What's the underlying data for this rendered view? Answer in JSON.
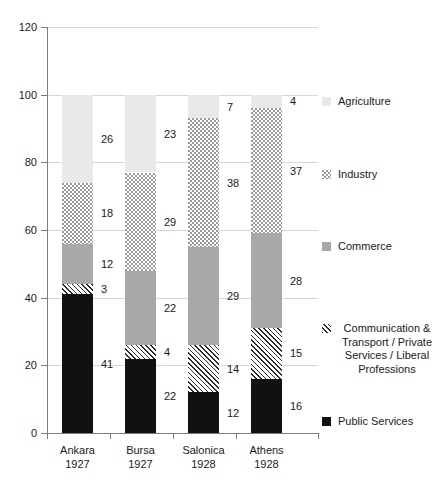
{
  "chart_data": {
    "type": "bar",
    "subtype": "stacked-column",
    "title": "",
    "xlabel": "",
    "ylabel": "",
    "ylim": [
      0,
      120
    ],
    "ytick_step": 20,
    "yticks": [
      "0",
      "20",
      "40",
      "60",
      "80",
      "100",
      "120"
    ],
    "grid": true,
    "legend_position": "right",
    "categories": [
      "Ankara",
      "Bursa",
      "Salonica",
      "Athens"
    ],
    "category_years": [
      "1927",
      "1927",
      "1928",
      "1928"
    ],
    "series": [
      {
        "name": "Public Services",
        "values": [
          41,
          22,
          12,
          16
        ],
        "pattern": "solid-black",
        "color": "#111111"
      },
      {
        "name": "Communication & Transport / Private Services / Liberal Professions",
        "values": [
          3,
          4,
          14,
          15
        ],
        "pattern": "diagonal-hatch",
        "color": "#2b2b2b"
      },
      {
        "name": "Commerce",
        "values": [
          12,
          22,
          29,
          28
        ],
        "pattern": "solid-gray",
        "color": "#a8a8a8"
      },
      {
        "name": "Industry",
        "values": [
          18,
          29,
          38,
          37
        ],
        "pattern": "dotted",
        "color": "#9a9a9a"
      },
      {
        "name": "Agriculture",
        "values": [
          26,
          23,
          7,
          4
        ],
        "pattern": "solid-light-gray",
        "color": "#e9e9e9"
      }
    ],
    "totals": [
      100,
      100,
      100,
      100
    ]
  },
  "legend": {
    "items": [
      {
        "label": "Agriculture",
        "key": "agriculture"
      },
      {
        "label": "Industry",
        "key": "industry"
      },
      {
        "label": "Commerce",
        "key": "commerce"
      },
      {
        "label": "Communication & Transport / Private Services / Liberal Professions",
        "key": "communication"
      },
      {
        "label": "Public Services",
        "key": "public"
      }
    ]
  }
}
